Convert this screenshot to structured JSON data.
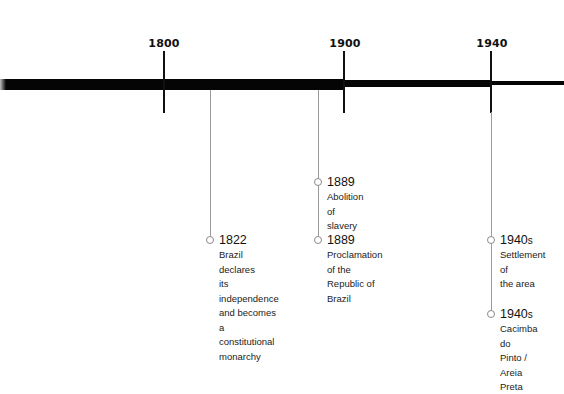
{
  "timeline": {
    "colors": {
      "bar": "#050505",
      "tick": "#111111",
      "connector": "#9a9a9a",
      "node_border": "#8a8a8a",
      "text": "#111111"
    },
    "ticks": [
      {
        "label": "1800",
        "x": 163
      },
      {
        "label": "1900",
        "x": 344
      },
      {
        "label": "1940",
        "x": 491
      }
    ],
    "segments": [
      {
        "from_x": 0,
        "to_x": 344,
        "thickness": 11
      },
      {
        "from_x": 344,
        "to_x": 491,
        "thickness": 7
      },
      {
        "from_x": 491,
        "to_x": 564,
        "thickness": 4
      }
    ],
    "events": [
      {
        "year": "1822",
        "year_suffix": "",
        "description": "Brazil declares\nits independence\nand becomes\na constitutional\nmonarchy"
      },
      {
        "year": "1889",
        "year_suffix": "",
        "description": "Abolition of slavery"
      },
      {
        "year": "1889",
        "year_suffix": "",
        "description": "Proclamation of the\nRepublic of Brazil"
      },
      {
        "year": "1940",
        "year_suffix": "s",
        "description": "Settlement of\nthe area"
      },
      {
        "year": "1940",
        "year_suffix": "s",
        "description": "Cacimba do\nPinto / Areia\nPreta"
      }
    ]
  }
}
